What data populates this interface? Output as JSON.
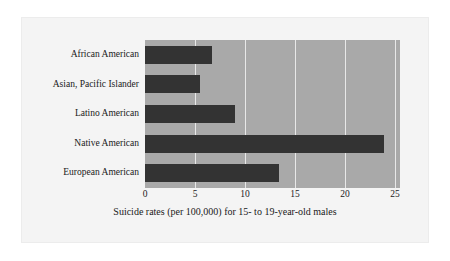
{
  "chart_data": {
    "type": "bar",
    "orientation": "horizontal",
    "title": "",
    "xlabel": "Suicide rates (per 100,000) for 15- to 19-year-old males",
    "ylabel": "",
    "categories": [
      "African American",
      "Asian, Pacific Islander",
      "Latino American",
      "Native American",
      "European American"
    ],
    "values": [
      6.7,
      5.5,
      9.0,
      23.9,
      13.4
    ],
    "xlim": [
      0,
      25.5
    ],
    "xticks": [
      0,
      5,
      10,
      15,
      20,
      25
    ],
    "xtick_labels": [
      "0",
      "5",
      "10",
      "15",
      "20",
      "25"
    ],
    "grid": true,
    "grid_axis": "x",
    "legend": null,
    "colors": {
      "bar": "#333333",
      "plot_background": "#a9a9a9",
      "gridline": "#e8e8e8",
      "figure_background": "#f4f4f4",
      "text": "#1a1a1a"
    }
  }
}
